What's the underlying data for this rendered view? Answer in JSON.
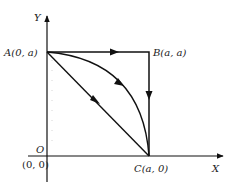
{
  "diagram": {
    "axes": {
      "x_label": "X",
      "y_label": "Y",
      "origin_label": "O",
      "origin_coords": "(0, 0)"
    },
    "points": {
      "A": {
        "name": "A",
        "coords": "(0, a)"
      },
      "B": {
        "name": "B",
        "coords": "(a, a)"
      },
      "C": {
        "name": "C",
        "coords": "(a, 0)"
      }
    },
    "paths": [
      {
        "id": "path-A-B-C",
        "description": "A to B along top, then B down to C"
      },
      {
        "id": "path-arc-A-C",
        "description": "Curved arc from A to C"
      },
      {
        "id": "path-diagonal-A-C",
        "description": "Straight line from A to C"
      }
    ],
    "colors": {
      "line": "#111111",
      "guide": "#cccccc"
    }
  }
}
